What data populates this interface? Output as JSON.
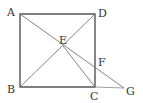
{
  "diagram": {
    "type": "geometry",
    "points": {
      "A": {
        "label": "A",
        "x": 20,
        "y": 14
      },
      "B": {
        "label": "B",
        "x": 20,
        "y": 87
      },
      "C": {
        "label": "C",
        "x": 95,
        "y": 87
      },
      "D": {
        "label": "D",
        "x": 95,
        "y": 14
      },
      "E": {
        "label": "E",
        "x": 63,
        "y": 46
      },
      "F": {
        "label": "F",
        "x": 95,
        "y": 67
      },
      "G": {
        "label": "G",
        "x": 124,
        "y": 88
      }
    },
    "segments": [
      "AB",
      "BC",
      "CD",
      "DA",
      "AG",
      "BD",
      "EC",
      "CG"
    ],
    "stroke_color": "#555555"
  }
}
